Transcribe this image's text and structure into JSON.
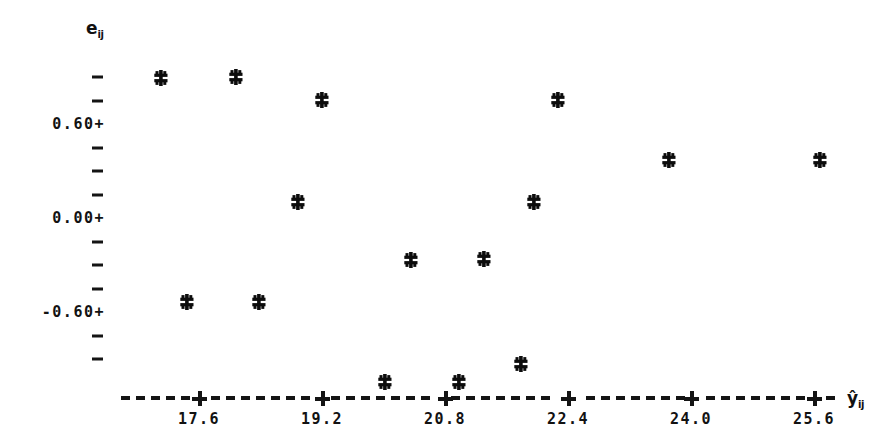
{
  "chart_data": {
    "type": "scatter",
    "title": "",
    "subtitle": "",
    "xlabel": "ŷij",
    "ylabel": "eij",
    "xlabel_base": "ŷ",
    "xlabel_sub": "ij",
    "ylabel_base": "e",
    "ylabel_sub": "ij",
    "grid": false,
    "legend": null,
    "marker_symbol": "*",
    "xlim": [
      16.6,
      26.6
    ],
    "ylim": [
      -1.05,
      1.05
    ],
    "xticks": [
      17.6,
      19.2,
      20.8,
      22.4,
      24.0,
      25.6
    ],
    "xtick_labels": [
      "17.6",
      "19.2",
      "20.8",
      "22.4",
      "24.0",
      "25.6"
    ],
    "yticks": [
      0.6,
      0.0,
      -0.6
    ],
    "ytick_labels": [
      "0.60+",
      "0.00+",
      "-0.60+"
    ],
    "y_minor_tick_count_top": 3,
    "y_minor_step": 0.15,
    "x": [
      17.13,
      18.1,
      19.22,
      19.68,
      20.42,
      21.37,
      21.71,
      22.03,
      22.47,
      22.64,
      24.19,
      25.81,
      17.78,
      18.71,
      20.02,
      20.77,
      21.13
    ],
    "y": [
      0.89,
      0.9,
      0.75,
      0.1,
      -0.27,
      -0.26,
      0.1,
      0.75,
      -0.93,
      0.37,
      0.37,
      -1.05,
      -0.54,
      -0.54,
      -1.05,
      -1.05,
      -0.93
    ],
    "points": [
      {
        "x": 17.13,
        "y": 0.89,
        "px": 161,
        "py": 78
      },
      {
        "x": 18.1,
        "y": 0.9,
        "px": 236,
        "py": 77
      },
      {
        "x": 17.78,
        "y": -0.54,
        "px": 187,
        "py": 302
      },
      {
        "x": 18.71,
        "y": -0.54,
        "px": 259,
        "py": 302
      },
      {
        "x": 19.22,
        "y": 0.75,
        "px": 322,
        "py": 100
      },
      {
        "x": 18.89,
        "y": 0.1,
        "px": 298,
        "py": 202
      },
      {
        "x": 20.02,
        "y": -1.05,
        "px": 385,
        "py": 382
      },
      {
        "x": 20.35,
        "y": -0.27,
        "px": 411,
        "py": 260
      },
      {
        "x": 20.77,
        "y": -1.05,
        "px": 459,
        "py": 382
      },
      {
        "x": 21.3,
        "y": -0.26,
        "px": 484,
        "py": 259
      },
      {
        "x": 21.78,
        "y": -0.93,
        "px": 521,
        "py": 364
      },
      {
        "x": 22.05,
        "y": 0.1,
        "px": 534,
        "py": 202
      },
      {
        "x": 22.27,
        "y": 0.75,
        "px": 558,
        "py": 100
      },
      {
        "x": 23.71,
        "y": 0.37,
        "px": 669,
        "py": 160
      },
      {
        "x": 25.67,
        "y": 0.37,
        "px": 820,
        "py": 160
      }
    ]
  },
  "axis": {
    "y_title": "e",
    "y_title_sub": "ij",
    "x_title": "ŷ",
    "x_title_sub": "ij"
  }
}
